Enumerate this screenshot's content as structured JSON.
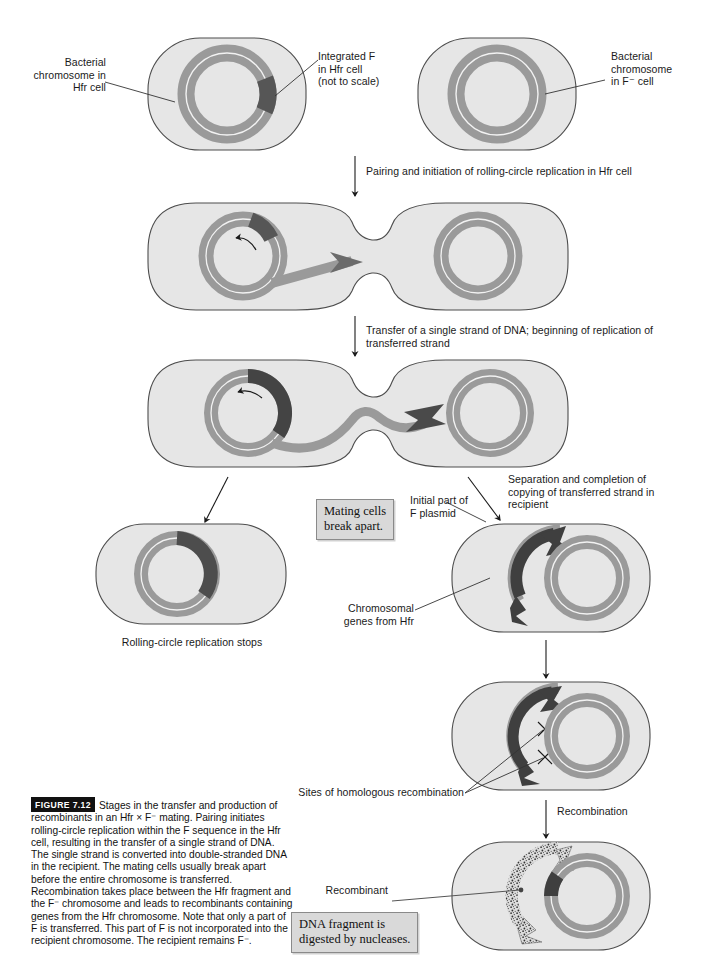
{
  "figure": {
    "number": "FIGURE 7.12",
    "caption": "Stages in the transfer and production of recombinants in an Hfr × F⁻ mating. Pairing initiates rolling-circle replication within the F sequence in the Hfr cell, resulting in the transfer of a single strand of DNA. The single strand is converted into double-stranded DNA in the recipient. The mating cells usually break apart before the entire chromosome is transferred. Recombination takes place between the Hfr fragment and the F⁻ chromosome and leads to recombinants containing genes from the Hfr chromosome. Note that only a part of F is transferred. This part of F is not incorporated into the recipient chromosome. The recipient remains F⁻."
  },
  "labels": {
    "bacterial_chromosome_hfr": "Bacterial\nchromosome in\nHfr cell",
    "integrated_f": "Integrated F\nin Hfr cell\n(not to scale)",
    "bacterial_chromosome_fminus": "Bacterial\nchromosome\nin F⁻ cell",
    "step_pairing": "Pairing and initiation of rolling-circle replication in Hfr cell",
    "step_transfer": "Transfer of a single strand of DNA; beginning of replication of\ntransferred strand",
    "step_separation": "Separation and completion of\ncopying of transferred strand in\nrecipient",
    "rolling_circle_stops": "Rolling-circle replication stops",
    "initial_part_f_plasmid": "Initial part of\nF plasmid",
    "chromosomal_genes_hfr": "Chromosomal\ngenes from Hfr",
    "sites_homologous_recombination": "Sites of homologous recombination",
    "step_recombination": "Recombination",
    "recombinant": "Recombinant"
  },
  "callouts": {
    "mating_cells": "Mating cells\nbreak apart.",
    "dna_fragment": "DNA fragment is\ndigested by nucleases."
  },
  "colors": {
    "cell_fill": "#e6e6e6",
    "cell_stroke": "#4d4d4d",
    "chromosome_gray": "#9a9a9a",
    "f_segment_dark": "#4a4a4a",
    "transferred_strand": "#3d3d3d",
    "inner_line": "#f2f2f2",
    "leader_line": "#333333",
    "callout_fill": "#d9d9d9",
    "callout_border": "#8a8a8a",
    "text": "#1a1a1a"
  },
  "diagram": {
    "type": "biology-process-flow",
    "topic": "Hfr × F⁻ conjugation and recombination",
    "steps": [
      {
        "id": "step1",
        "name": "hfr-and-fminus-cells",
        "cells": [
          "Hfr cell with integrated F",
          "F⁻ recipient cell"
        ]
      },
      {
        "id": "step2",
        "name": "paired-cells-rolling-circle-initiation",
        "cells": [
          "Hfr cell",
          "F⁻ cell"
        ]
      },
      {
        "id": "step3",
        "name": "paired-cells-strand-transfer",
        "cells": [
          "Hfr cell",
          "F⁻ cell"
        ]
      },
      {
        "id": "step4a",
        "name": "hfr-cell-replication-stops",
        "cells": [
          "Hfr cell"
        ]
      },
      {
        "id": "step4b",
        "name": "recipient-with-transferred-fragment",
        "cells": [
          "Recipient cell"
        ]
      },
      {
        "id": "step5",
        "name": "recipient-homologous-recombination",
        "cells": [
          "Recipient cell"
        ]
      },
      {
        "id": "step6",
        "name": "recombinant-cell",
        "cells": [
          "Recombinant cell"
        ]
      }
    ]
  }
}
